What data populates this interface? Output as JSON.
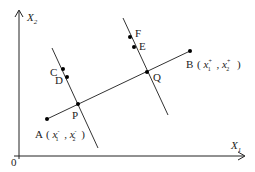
{
  "axes": {
    "x_label": "X",
    "x_sub": "1",
    "y_label": "X",
    "y_sub": "2",
    "origin_label": "0"
  },
  "points": {
    "A": {
      "label": "A",
      "coord_open": "(",
      "x_var": "x",
      "x_sub": "1",
      "x_sup": "-",
      "sep": ",",
      "y_var": "x",
      "y_sub": "2",
      "y_sup": "-",
      "coord_close": ")"
    },
    "B": {
      "label": "B",
      "coord_open": "(",
      "x_var": "x",
      "x_sub": "1",
      "x_sup": "+",
      "sep": ",",
      "y_var": "x",
      "y_sub": "2",
      "y_sup": "+",
      "coord_close": ")"
    },
    "C": {
      "label": "C"
    },
    "D": {
      "label": "D"
    },
    "E": {
      "label": "E"
    },
    "F": {
      "label": "F"
    },
    "P": {
      "label": "P"
    },
    "Q": {
      "label": "Q"
    }
  },
  "colors": {
    "line": "#333333",
    "axis": "#222222",
    "point": "#000000"
  }
}
